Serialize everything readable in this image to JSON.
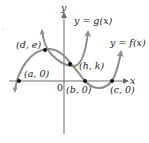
{
  "figure": {
    "axes": {
      "x_label": "x",
      "y_label": "y",
      "origin_label": "0"
    },
    "curves": [
      {
        "name": "g",
        "label": "y = g(x)",
        "color": "#8c8c8c"
      },
      {
        "name": "f",
        "label": "y = f(x)",
        "color": "#8c8c8c"
      }
    ],
    "points": [
      {
        "id": "a",
        "label": "(a, 0)"
      },
      {
        "id": "d_e",
        "label": "(d, e)"
      },
      {
        "id": "h_k",
        "label": "(h, k)"
      },
      {
        "id": "b",
        "label": "(b, 0)"
      },
      {
        "id": "c",
        "label": "(c, 0)"
      }
    ],
    "colors": {
      "axis": "#6e6e6e",
      "curve": "#8c8c8c",
      "point": "#111111",
      "text": "#222222"
    }
  }
}
